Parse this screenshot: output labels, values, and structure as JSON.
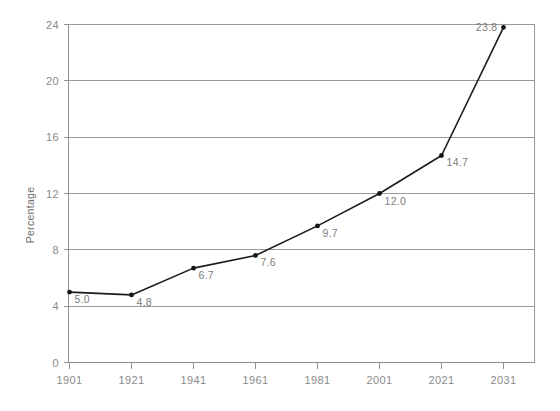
{
  "chart_data": {
    "type": "line",
    "title": "",
    "subtitle": "",
    "xlabel": "",
    "ylabel": "Percentage",
    "categories": [
      "1901",
      "1921",
      "1941",
      "1961",
      "1981",
      "2001",
      "2021",
      "2031"
    ],
    "values": [
      5.0,
      4.8,
      6.7,
      7.6,
      9.7,
      12.0,
      14.7,
      23.8
    ],
    "point_labels": [
      "5.0",
      "4.8",
      "6.7",
      "7.6",
      "9.7",
      "12.0",
      "14.7",
      "23.8"
    ],
    "label_positions": [
      "right-below",
      "right-below",
      "right-below",
      "right-below",
      "right-below",
      "right-below",
      "right-below",
      "left-above"
    ],
    "ylim": [
      0,
      24
    ],
    "yticks": [
      0,
      4,
      8,
      12,
      16,
      20,
      24
    ],
    "ytick_labels": [
      "0",
      "4",
      "8",
      "12",
      "16",
      "20",
      "24"
    ],
    "grid": true,
    "grid_axis": "y",
    "legend": false,
    "legend_position": "none",
    "marker": "circle",
    "line_color": "#1c1c1c",
    "grid_color": "#9a9a9a",
    "text_color": "#8a8a8a",
    "background_color": "#ffffff"
  },
  "axis": {
    "y_title": "Percentage",
    "y_ticks": [
      {
        "label": "24",
        "value": 24
      },
      {
        "label": "20",
        "value": 20
      },
      {
        "label": "16",
        "value": 16
      },
      {
        "label": "12",
        "value": 12
      },
      {
        "label": "8",
        "value": 8
      },
      {
        "label": "4",
        "value": 4
      },
      {
        "label": "0",
        "value": 0
      }
    ],
    "x_ticks": [
      {
        "label": "1901"
      },
      {
        "label": "1921"
      },
      {
        "label": "1941"
      },
      {
        "label": "1961"
      },
      {
        "label": "1981"
      },
      {
        "label": "2001"
      },
      {
        "label": "2021"
      },
      {
        "label": "2031"
      }
    ]
  },
  "points": [
    {
      "label": "5.0",
      "category": "1901",
      "value": 5.0
    },
    {
      "label": "4.8",
      "category": "1921",
      "value": 4.8
    },
    {
      "label": "6.7",
      "category": "1941",
      "value": 6.7
    },
    {
      "label": "7.6",
      "category": "1961",
      "value": 7.6
    },
    {
      "label": "9.7",
      "category": "1981",
      "value": 9.7
    },
    {
      "label": "12.0",
      "category": "2001",
      "value": 12.0
    },
    {
      "label": "14.7",
      "category": "2021",
      "value": 14.7
    },
    {
      "label": "23.8",
      "category": "2031",
      "value": 23.8
    }
  ]
}
